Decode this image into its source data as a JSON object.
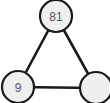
{
  "diagram": {
    "type": "undirected-graph",
    "shape": "triangle",
    "width": 110,
    "height": 103,
    "background_color": "#ffffff",
    "node_fill_color": "#efefef",
    "node_stroke_color": "#1a1a1a",
    "node_label_color": "#555555",
    "edge_color": "#1a1a1a",
    "node_radius": 16,
    "nodes": [
      {
        "id": "top",
        "label": "81",
        "cx": 56,
        "cy": 16,
        "r": 16,
        "has_label": true
      },
      {
        "id": "bottom-left",
        "label": "9",
        "cx": 18,
        "cy": 87,
        "r": 16,
        "has_label": true
      },
      {
        "id": "bottom-right",
        "label": "",
        "cx": 96,
        "cy": 88,
        "r": 16,
        "has_label": false
      }
    ],
    "edges": [
      {
        "from": "top",
        "to": "bottom-left",
        "x1": 56,
        "y1": 16,
        "x2": 18,
        "y2": 87
      },
      {
        "from": "top",
        "to": "bottom-right",
        "x1": 56,
        "y1": 16,
        "x2": 96,
        "y2": 88
      },
      {
        "from": "bottom-left",
        "to": "bottom-right",
        "x1": 18,
        "y1": 87,
        "x2": 96,
        "y2": 88
      }
    ]
  }
}
